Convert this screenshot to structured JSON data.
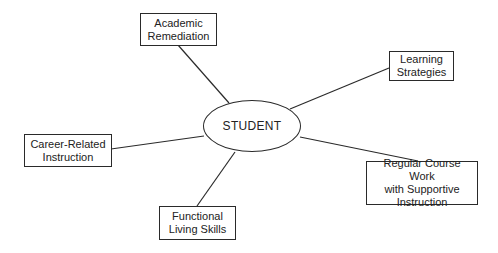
{
  "diagram": {
    "type": "hub-and-spoke",
    "center": {
      "label": "STUDENT"
    },
    "nodes": [
      {
        "id": "academic-remediation",
        "lines": [
          "Academic",
          "Remediation"
        ]
      },
      {
        "id": "learning-strategies",
        "lines": [
          "Learning",
          "Strategies"
        ]
      },
      {
        "id": "career-related-instruction",
        "lines": [
          "Career-Related",
          "Instruction"
        ]
      },
      {
        "id": "regular-course-work",
        "lines": [
          "Regular Course Work",
          "with Supportive",
          "Instruction"
        ]
      },
      {
        "id": "functional-living-skills",
        "lines": [
          "Functional",
          "Living Skills"
        ]
      }
    ],
    "colors": {
      "line": "#2a2a2a",
      "background": "#ffffff",
      "text": "#222222"
    }
  }
}
